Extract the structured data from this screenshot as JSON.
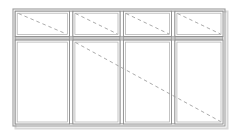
{
  "document": {
    "type": "architectural-elevation",
    "subject": "window-wall-elevation",
    "title": "",
    "units": "px",
    "canvas": {
      "width": 240,
      "height": 138
    },
    "background_color": "#ffffff"
  },
  "colors": {
    "frame_outer": "#9a9a9a",
    "frame_inner": "#b0b0b0",
    "sash_line": "#8c8c8c",
    "rail_fill": "#c9c9c9",
    "glass_fill": "#ffffff",
    "swing_dash": "#a0a0a0",
    "shadow": "#d8d8d8"
  },
  "geometry": {
    "outer_frame": {
      "x": 13,
      "y": 9,
      "width": 212,
      "height": 117,
      "stroke_width": 1.1
    },
    "inner_frame_inset": 2.2,
    "transom_rail": {
      "y": 36.5,
      "height": 3.6
    },
    "mullions": [
      {
        "id": "mullion-1",
        "x": 69.5,
        "width": 3.4
      },
      {
        "id": "mullion-2",
        "x": 120.0,
        "width": 3.4
      },
      {
        "id": "mullion-3",
        "x": 171.5,
        "width": 3.4
      }
    ],
    "shadow_offset": {
      "x": 2.5,
      "y": 2.5
    }
  },
  "panels": {
    "transom_row": {
      "label": "transom-lights",
      "top": 11,
      "bottom": 36.5
    },
    "main_row": {
      "label": "main-lights",
      "top": 40.1,
      "bottom": 124
    },
    "items": [
      {
        "id": "transom-light-1",
        "name": "transom-light-left",
        "row": "transom",
        "x": 15.2,
        "y": 11.2,
        "width": 54.3,
        "height": 25.3,
        "glazed": true
      },
      {
        "id": "transom-light-2",
        "name": "transom-light-center-left",
        "row": "transom",
        "x": 72.9,
        "y": 11.2,
        "width": 47.1,
        "height": 25.3,
        "glazed": true
      },
      {
        "id": "transom-light-3",
        "name": "transom-light-center-right",
        "row": "transom",
        "x": 123.4,
        "y": 11.2,
        "width": 48.1,
        "height": 25.3,
        "glazed": true
      },
      {
        "id": "transom-light-4",
        "name": "transom-light-right",
        "row": "transom",
        "x": 174.9,
        "y": 11.2,
        "width": 48.1,
        "height": 25.3,
        "glazed": true
      },
      {
        "id": "main-light-1",
        "name": "main-light-left",
        "row": "main",
        "x": 15.2,
        "y": 40.1,
        "width": 54.3,
        "height": 83.9,
        "glazed": true
      },
      {
        "id": "main-light-2",
        "name": "main-light-center-left",
        "row": "main",
        "x": 72.9,
        "y": 40.1,
        "width": 47.1,
        "height": 83.9,
        "glazed": true
      },
      {
        "id": "main-light-3",
        "name": "main-light-center-right",
        "row": "main",
        "x": 123.4,
        "y": 40.1,
        "width": 48.1,
        "height": 83.9,
        "glazed": true
      },
      {
        "id": "main-light-4",
        "name": "main-light-right",
        "row": "main",
        "x": 174.9,
        "y": 40.1,
        "width": 48.1,
        "height": 83.9,
        "glazed": true
      }
    ]
  },
  "swing_indicators": {
    "style": {
      "dash_pattern": "3.5 3",
      "stroke_width": 0.9,
      "color": "#a0a0a0"
    },
    "lines": [
      {
        "id": "swing-transom-1",
        "name": "swing-line-transom-left",
        "x1": 18.5,
        "y1": 13.5,
        "x2": 66.5,
        "y2": 34.0
      },
      {
        "id": "swing-transom-2",
        "name": "swing-line-transom-center-left",
        "x1": 75.5,
        "y1": 13.5,
        "x2": 117.5,
        "y2": 34.0
      },
      {
        "id": "swing-transom-3",
        "name": "swing-line-transom-center-right",
        "x1": 126.0,
        "y1": 13.5,
        "x2": 169.0,
        "y2": 34.0
      },
      {
        "id": "swing-transom-4",
        "name": "swing-line-transom-right",
        "x1": 177.5,
        "y1": 13.5,
        "x2": 220.5,
        "y2": 34.0
      },
      {
        "id": "swing-main-long",
        "name": "swing-line-main-diagonal",
        "x1": 75.5,
        "y1": 42.5,
        "x2": 220.5,
        "y2": 121.5
      }
    ]
  },
  "labels": {
    "drawing_title": "",
    "notes": []
  }
}
